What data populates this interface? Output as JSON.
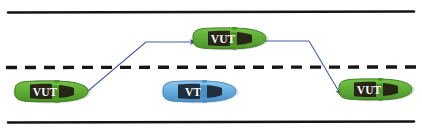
{
  "scene": {
    "title": "Overtaking maneuver road diagram",
    "background_color": "#ffffff",
    "width": 422,
    "height": 132
  },
  "road": {
    "top_edge_label": "solid-lane-boundary-top",
    "bottom_edge_label": "solid-lane-boundary-bottom",
    "center_line_label": "dashed-center-line",
    "line_color": "#111111",
    "top_edge_y": 12,
    "center_line_y": 67,
    "bottom_edge_y": 122,
    "dash_pattern": "11 8"
  },
  "vehicles": [
    {
      "id": "vut-start",
      "label": "VUT",
      "color": "#5aa832",
      "body_color": "#63b23a",
      "shade_color": "#3f8a22",
      "x": 12,
      "y": 80,
      "lane": "bottom",
      "heading": "right"
    },
    {
      "id": "vut-overtaking",
      "label": "VUT",
      "color": "#5aa832",
      "body_color": "#63b23a",
      "shade_color": "#3f8a22",
      "x": 190,
      "y": 27,
      "lane": "top",
      "heading": "right"
    },
    {
      "id": "vt-target",
      "label": "VT",
      "color": "#5fa8dd",
      "body_color": "#6bb4e8",
      "shade_color": "#3e84bb",
      "x": 160,
      "y": 80,
      "lane": "bottom",
      "heading": "right"
    },
    {
      "id": "vut-end",
      "label": "VUT",
      "color": "#5aa832",
      "body_color": "#63b23a",
      "shade_color": "#3f8a22",
      "x": 336,
      "y": 78,
      "lane": "bottom",
      "heading": "right"
    }
  ],
  "trajectories": [
    {
      "id": "lane-change-out",
      "color": "#4a5fa8",
      "points": "82,96 146,42 196,42",
      "arrowhead_at": "end"
    },
    {
      "id": "lane-change-in",
      "color": "#4a5fa8",
      "points": "264,41 309,41 341,95",
      "arrowhead_at": "end"
    }
  ]
}
